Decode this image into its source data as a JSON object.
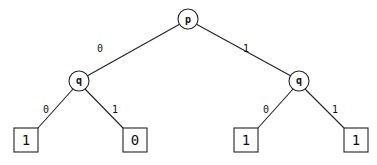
{
  "diagram": {
    "type": "binary decision tree",
    "root": {
      "id": "n0",
      "label": "p"
    },
    "internal_nodes": [
      {
        "id": "n0",
        "label": "p"
      },
      {
        "id": "n1",
        "label": "q"
      },
      {
        "id": "n2",
        "label": "q"
      }
    ],
    "leaves": [
      {
        "id": "l0",
        "label": "1"
      },
      {
        "id": "l1",
        "label": "0"
      },
      {
        "id": "l2",
        "label": "1"
      },
      {
        "id": "l3",
        "label": "1"
      }
    ],
    "edges": [
      {
        "from": "n0",
        "to": "n1",
        "label": "0"
      },
      {
        "from": "n0",
        "to": "n2",
        "label": "1"
      },
      {
        "from": "n1",
        "to": "l0",
        "label": "0"
      },
      {
        "from": "n1",
        "to": "l1",
        "label": "1"
      },
      {
        "from": "n2",
        "to": "l2",
        "label": "0"
      },
      {
        "from": "n2",
        "to": "l3",
        "label": "1"
      }
    ]
  }
}
